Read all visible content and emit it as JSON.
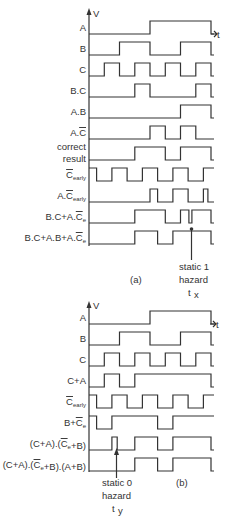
{
  "diagram": {
    "axis_labels": {
      "y": "V",
      "x": "t"
    },
    "panel_a": {
      "caption": "(a)",
      "rows": [
        {
          "label": "A",
          "edges": [
            4,
            8
          ],
          "start": 0
        },
        {
          "label": "B",
          "edges": [
            2,
            4,
            6,
            8
          ],
          "start": 0
        },
        {
          "label": "C",
          "edges": [
            1,
            2,
            3,
            4,
            5,
            6,
            7,
            8
          ],
          "start": 0
        },
        {
          "label": "B.C",
          "edges": [
            3,
            4,
            7,
            8
          ],
          "start": 0
        },
        {
          "label": "A.B",
          "edges": [
            6,
            8
          ],
          "start": 0
        },
        {
          "label": "A.C̄",
          "edges": [
            4,
            5,
            6,
            7
          ],
          "start": 0
        },
        {
          "label": "correct result",
          "edges": [
            3,
            5,
            6,
            8
          ],
          "start": 0
        },
        {
          "label": "C̄early",
          "edges": [
            0.5,
            1.5,
            2.5,
            3.5,
            4.5,
            5.5,
            6.5,
            7.5
          ],
          "start": 1
        },
        {
          "label": "A.C̄early",
          "edges": [
            4,
            4.5,
            5.5,
            6.5,
            7.5,
            7.8
          ],
          "start": 0
        },
        {
          "label": "B.C+A.C̄e",
          "edges": [
            3,
            5,
            6,
            6.55,
            6.75,
            8
          ],
          "start": 0
        },
        {
          "label": "B.C+A.B+A.C̄e",
          "edges": [
            3,
            4.5,
            5.5,
            8
          ],
          "start": 0
        }
      ],
      "annotation": {
        "lines": [
          "static 1",
          "hazard",
          "t",
          "x"
        ],
        "at": 6.65
      }
    },
    "panel_b": {
      "caption": "(b)",
      "rows": [
        {
          "label": "A",
          "edges": [
            4,
            8
          ],
          "start": 0
        },
        {
          "label": "B",
          "edges": [
            2,
            4,
            6,
            8
          ],
          "start": 0
        },
        {
          "label": "C",
          "edges": [
            1,
            2,
            3,
            4,
            5,
            6,
            7,
            8
          ],
          "start": 0
        },
        {
          "label": "C+A",
          "edges": [
            1,
            2,
            3,
            8
          ],
          "start": 0
        },
        {
          "label": "C̄early",
          "edges": [
            0.5,
            1.5,
            2.5,
            3.5,
            4.5,
            5.5,
            6.5,
            7.5
          ],
          "start": 1
        },
        {
          "label": "B+C̄e",
          "edges": [
            0.5,
            1.5,
            4.5,
            5.5
          ],
          "start": 1
        },
        {
          "label": "(C+A).(C̄e+B)",
          "edges": [
            1.5,
            1.85,
            3,
            4.5,
            5.5,
            8
          ],
          "start": 0
        },
        {
          "label": "(C+A).(C̄e+B).(A+B)",
          "edges": [
            3,
            4.5,
            5.5,
            8
          ],
          "start": 0
        }
      ],
      "annotation": {
        "lines": [
          "static 0",
          "hazard",
          "t",
          "y"
        ],
        "at": 1.7
      }
    }
  }
}
